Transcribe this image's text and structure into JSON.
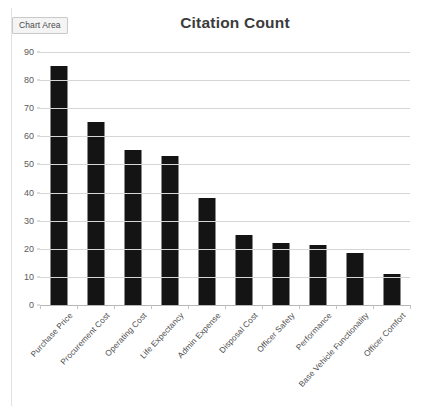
{
  "overlay": {
    "chart_area_chip": "Chart Area"
  },
  "chart_data": {
    "type": "bar",
    "title": "Citation Count",
    "xlabel": "",
    "ylabel": "",
    "ylim": [
      0,
      90
    ],
    "ytick_step": 10,
    "yticks": [
      0,
      10,
      20,
      30,
      40,
      50,
      60,
      70,
      80,
      90
    ],
    "ytick_labels": [
      "0",
      "10",
      "20",
      "30",
      "40",
      "50",
      "60",
      "70",
      "80",
      "90"
    ],
    "grid": true,
    "legend": false,
    "legend_position": "none",
    "bar_color": "#141414",
    "gridline_color": "#d6d6d6",
    "categories": [
      "Purchase Price",
      "Procurement Cost",
      "Operating Cost",
      "Life Expectancy",
      "Admin Expense",
      "Disposal Cost",
      "Officer Safety",
      "Performance",
      "Base Vehicle Functionality",
      "Officer Comfort"
    ],
    "values": [
      85,
      65,
      55,
      53,
      38,
      25,
      22,
      21.5,
      18.5,
      11
    ]
  }
}
